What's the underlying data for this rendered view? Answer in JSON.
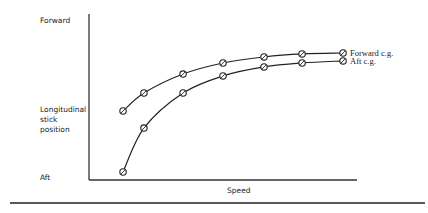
{
  "chart_data": {
    "type": "line",
    "title": "",
    "xlabel": "Speed",
    "ylabel": "Longitudinal stick position",
    "y_top_label": "Forward",
    "y_bottom_label": "Aft",
    "xlim": [
      0,
      10
    ],
    "ylim": [
      0,
      10
    ],
    "grid": false,
    "legend_placement": "right-end-of-lines",
    "series": [
      {
        "name": "Forward c.g.",
        "x": [
          1.27,
          2.05,
          3.51,
          5.0,
          6.53,
          7.95,
          9.48
        ],
        "y": [
          4.24,
          5.38,
          6.58,
          7.28,
          7.66,
          7.85,
          7.91
        ],
        "marker": "circle-slash"
      },
      {
        "name": "Aft c.g.",
        "x": [
          1.27,
          2.05,
          3.51,
          5.0,
          6.53,
          7.95,
          9.48
        ],
        "y": [
          0.38,
          3.16,
          5.38,
          6.46,
          7.03,
          7.28,
          7.41
        ],
        "marker": "circle-slash"
      }
    ]
  }
}
